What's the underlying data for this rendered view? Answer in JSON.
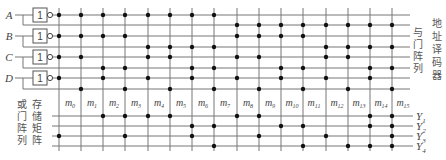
{
  "diagram": {
    "colors": {
      "line": "#777777",
      "dot": "#111111",
      "text": "#444444"
    },
    "inputs": [
      {
        "label": "A",
        "y": 15,
        "y_true": 25
      },
      {
        "label": "B",
        "y": 36,
        "y_true": 47
      },
      {
        "label": "C",
        "y": 57,
        "y_true": 68
      },
      {
        "label": "D",
        "y": 78,
        "y_true": 89
      }
    ],
    "gate_symbol": "1",
    "columns_x": [
      59,
      81,
      103,
      125,
      148,
      170,
      192,
      214,
      237,
      259,
      281,
      303,
      326,
      348,
      370,
      392
    ],
    "minterms": [
      {
        "label": "m",
        "sub": "0"
      },
      {
        "label": "m",
        "sub": "1"
      },
      {
        "label": "m",
        "sub": "2"
      },
      {
        "label": "m",
        "sub": "3"
      },
      {
        "label": "m",
        "sub": "4"
      },
      {
        "label": "m",
        "sub": "5"
      },
      {
        "label": "m",
        "sub": "6"
      },
      {
        "label": "m",
        "sub": "7"
      },
      {
        "label": "m",
        "sub": "8"
      },
      {
        "label": "m",
        "sub": "9"
      },
      {
        "label": "m",
        "sub": "10"
      },
      {
        "label": "m",
        "sub": "11"
      },
      {
        "label": "m",
        "sub": "12"
      },
      {
        "label": "m",
        "sub": "13"
      },
      {
        "label": "m",
        "sub": "14"
      },
      {
        "label": "m",
        "sub": "15"
      }
    ],
    "outputs": [
      {
        "label": "Y",
        "sub": "1",
        "y": 116
      },
      {
        "label": "Y",
        "sub": "2",
        "y": 126
      },
      {
        "label": "Y",
        "sub": "3",
        "y": 136
      },
      {
        "label": "Y",
        "sub": "4",
        "y": 146
      }
    ],
    "or_connections": {
      "Y1": [
        2,
        3,
        4,
        5,
        8,
        9,
        14,
        15
      ],
      "Y2": [
        6,
        7,
        10,
        11,
        14,
        15
      ],
      "Y3": [
        0,
        3,
        6,
        9,
        12,
        15
      ],
      "Y4": [
        7,
        11,
        13,
        14,
        15
      ]
    },
    "labels": {
      "and_array": [
        "与",
        "门",
        "阵",
        "列"
      ],
      "address_decoder": [
        "地",
        "址",
        "译",
        "码",
        "器"
      ],
      "or_array": [
        "或",
        "门",
        "阵",
        "列"
      ],
      "storage_matrix": [
        "存",
        "储",
        "矩",
        "阵"
      ]
    }
  }
}
